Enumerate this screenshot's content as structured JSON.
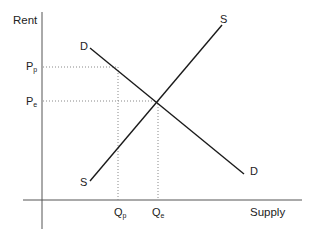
{
  "diagram": {
    "type": "supply-demand",
    "y_axis_label": "Rent",
    "x_axis_label": "Supply",
    "price_labels": [
      {
        "main": "P",
        "sub": "p"
      },
      {
        "main": "P",
        "sub": "e"
      }
    ],
    "quantity_labels": [
      {
        "main": "Q",
        "sub": "p"
      },
      {
        "main": "Q",
        "sub": "e"
      }
    ],
    "demand_curve": {
      "label_start": "D",
      "label_end": "D"
    },
    "supply_curve": {
      "label_start": "S",
      "label_end": "S"
    },
    "colors": {
      "line": "#1a1a1a",
      "guide": "#888888",
      "axis": "#555555"
    }
  }
}
